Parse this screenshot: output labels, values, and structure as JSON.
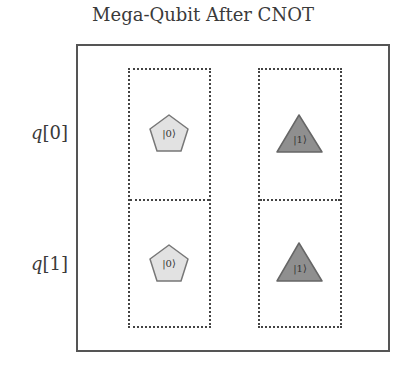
{
  "title": "Mega-Qubit After CNOT",
  "qubits": [
    {
      "label_var": "q",
      "label_index": "[0]"
    },
    {
      "label_var": "q",
      "label_index": "[1]"
    }
  ],
  "columns": [
    {
      "state_label": "|0⟩",
      "shape": "pentagon",
      "fill": "#e2e2e2"
    },
    {
      "state_label": "|1⟩",
      "shape": "triangle",
      "fill": "#8f8f8f"
    }
  ],
  "cells": [
    {
      "row": 0,
      "col": 0,
      "shape": "pentagon",
      "label": "|0⟩"
    },
    {
      "row": 0,
      "col": 1,
      "shape": "triangle",
      "label": "|1⟩"
    },
    {
      "row": 1,
      "col": 0,
      "shape": "pentagon",
      "label": "|0⟩"
    },
    {
      "row": 1,
      "col": 1,
      "shape": "triangle",
      "label": "|1⟩"
    }
  ]
}
